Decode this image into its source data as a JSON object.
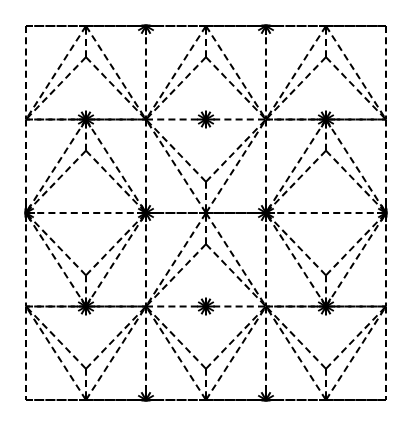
{
  "figure": {
    "type": "line-diagram",
    "background_color": "#ffffff",
    "line_color": "#000000",
    "line_style": "dashed",
    "stroke_width": 2,
    "dash_length": 7,
    "dash_gap": 4.2,
    "canvas_width": 409,
    "canvas_height": 425
  },
  "geometry": {
    "bounds": {
      "x0": 26,
      "y0": 26,
      "x1": 386,
      "y1": 400
    },
    "cell_width": 120,
    "cell_height": 93.5,
    "columns": 3,
    "rows": 4,
    "column_x": [
      26,
      146,
      266,
      386
    ],
    "row_y": [
      26,
      119.5,
      213,
      306.5,
      400
    ],
    "hub_ray_count": 12,
    "hub_ray_length": 9,
    "y_vertex_offset_ratio": 0.3333
  },
  "hubs": [
    {
      "name": "hub-top-mid-left",
      "x": 146,
      "y": 26,
      "rays": 12
    },
    {
      "name": "hub-top-mid-right",
      "x": 266,
      "y": 26,
      "rays": 12
    },
    {
      "name": "hub-row2-left",
      "x": 86,
      "y": 119.5,
      "rays": 12
    },
    {
      "name": "hub-row2-mid",
      "x": 206,
      "y": 119.5,
      "rays": 12
    },
    {
      "name": "hub-row2-right",
      "x": 326,
      "y": 119.5,
      "rays": 12
    },
    {
      "name": "hub-row3-edge-left",
      "x": 26,
      "y": 213,
      "rays": 12
    },
    {
      "name": "hub-row3-mid-left",
      "x": 146,
      "y": 213,
      "rays": 12
    },
    {
      "name": "hub-row3-mid-right",
      "x": 266,
      "y": 213,
      "rays": 12
    },
    {
      "name": "hub-row3-edge-right",
      "x": 386,
      "y": 213,
      "rays": 12
    },
    {
      "name": "hub-row4-left",
      "x": 86,
      "y": 306.5,
      "rays": 12
    },
    {
      "name": "hub-row4-mid",
      "x": 206,
      "y": 306.5,
      "rays": 12
    },
    {
      "name": "hub-row4-right",
      "x": 326,
      "y": 306.5,
      "rays": 12
    },
    {
      "name": "hub-bottom-mid-left",
      "x": 146,
      "y": 400,
      "rays": 12
    },
    {
      "name": "hub-bottom-mid-right",
      "x": 266,
      "y": 400,
      "rays": 12
    }
  ],
  "cells": [
    {
      "col": 0,
      "row": 0,
      "apex": "top"
    },
    {
      "col": 1,
      "row": 0,
      "apex": "top"
    },
    {
      "col": 2,
      "row": 0,
      "apex": "top"
    },
    {
      "col": 0,
      "row": 1,
      "apex": "top"
    },
    {
      "col": 1,
      "row": 1,
      "apex": "bottom"
    },
    {
      "col": 2,
      "row": 1,
      "apex": "top"
    },
    {
      "col": 0,
      "row": 2,
      "apex": "bottom"
    },
    {
      "col": 1,
      "row": 2,
      "apex": "top"
    },
    {
      "col": 2,
      "row": 2,
      "apex": "bottom"
    },
    {
      "col": 0,
      "row": 3,
      "apex": "bottom"
    },
    {
      "col": 1,
      "row": 3,
      "apex": "bottom"
    },
    {
      "col": 2,
      "row": 3,
      "apex": "bottom"
    }
  ]
}
